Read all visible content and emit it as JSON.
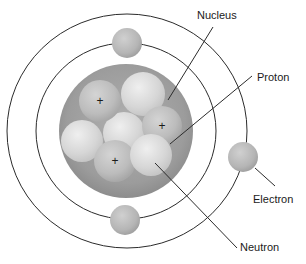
{
  "diagram": {
    "type": "atom-model",
    "colors": {
      "background": "#ffffff",
      "orbit_line": "#2b2b2b",
      "leader_line": "#2b2b2b",
      "nucleus_fill": "#9f9f9f",
      "nucleus_edge": "#8a8a8a",
      "proton_fill": "#bdbdbd",
      "neutron_fill": "#dcdcdc",
      "electron_fill": "#b8b8b8",
      "label_text": "#1a1a1a"
    },
    "orbits": [
      {
        "name": "inner",
        "cx": 126,
        "cy": 131,
        "rx": 90,
        "ry": 88
      },
      {
        "name": "outer",
        "cx": 127,
        "cy": 131,
        "rx": 120,
        "ry": 117
      }
    ],
    "nucleus": {
      "cx": 126,
      "cy": 131,
      "r": 67
    },
    "particles": [
      {
        "kind": "neutron",
        "cx": 82,
        "cy": 141,
        "r": 21
      },
      {
        "kind": "neutron",
        "cx": 124,
        "cy": 133,
        "r": 21
      },
      {
        "kind": "neutron",
        "cx": 143,
        "cy": 94,
        "r": 22
      },
      {
        "kind": "proton",
        "cx": 100,
        "cy": 101,
        "r": 21,
        "charge": "+"
      },
      {
        "kind": "proton",
        "cx": 162,
        "cy": 126,
        "r": 20,
        "charge": "+"
      },
      {
        "kind": "proton",
        "cx": 115,
        "cy": 161,
        "r": 21,
        "charge": "+"
      },
      {
        "kind": "neutron",
        "cx": 151,
        "cy": 155,
        "r": 21
      }
    ],
    "electrons": [
      {
        "name": "top",
        "cx": 127,
        "cy": 43,
        "r": 15
      },
      {
        "name": "bottom",
        "cx": 125,
        "cy": 220,
        "r": 15
      },
      {
        "name": "right",
        "cx": 243,
        "cy": 157,
        "r": 15
      }
    ],
    "labels": {
      "nucleus": "Nucleus",
      "proton": "Proton",
      "electron": "Electron",
      "neutron": "Neutron"
    },
    "leaders": [
      {
        "for": "nucleus",
        "x1": 168,
        "y1": 100,
        "x2": 213,
        "y2": 27,
        "tx": 197,
        "ty": 19
      },
      {
        "for": "proton",
        "x1": 170,
        "y1": 144,
        "x2": 252,
        "y2": 76,
        "tx": 257,
        "ty": 81
      },
      {
        "for": "electron",
        "x1": 255,
        "y1": 168,
        "x2": 275,
        "y2": 186,
        "tx": 253,
        "ty": 203
      },
      {
        "for": "neutron",
        "x1": 155,
        "y1": 163,
        "x2": 237,
        "y2": 248,
        "tx": 240,
        "ty": 251
      }
    ]
  }
}
